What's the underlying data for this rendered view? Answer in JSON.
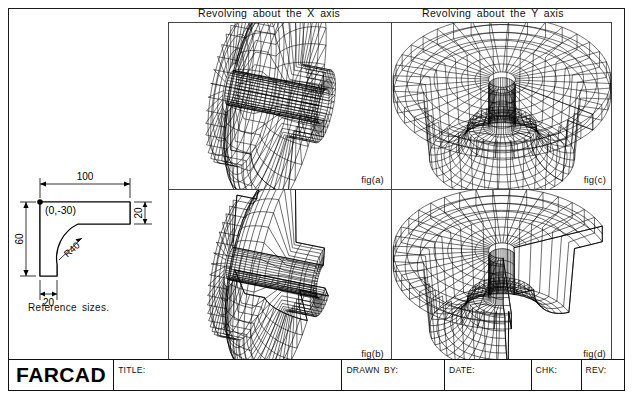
{
  "sheet": {
    "headings": {
      "x_axis": "Revolving about the X axis",
      "y_axis": "Revolving about the Y axis"
    },
    "figures": [
      {
        "id": "fig-a",
        "label": "fig(a)",
        "axis": "X",
        "kind": "full-revolution-solid"
      },
      {
        "id": "fig-c",
        "label": "fig(c)",
        "axis": "Y",
        "kind": "full-revolution-solid"
      },
      {
        "id": "fig-b",
        "label": "fig(b)",
        "axis": "X",
        "kind": "partial-revolution-solid"
      },
      {
        "id": "fig-d",
        "label": "fig(d)",
        "axis": "Y",
        "kind": "partial-revolution-solid"
      }
    ],
    "reference": {
      "caption": "Reference sizes.",
      "origin_label": "(0,-30)",
      "dim_top": "100",
      "dim_left": "60",
      "dim_right": "20",
      "dim_bottom": "20",
      "radius": "R40"
    },
    "title_block": {
      "logo": "FARCAD",
      "fields": [
        {
          "key": "title",
          "label": "TITLE:",
          "value": ""
        },
        {
          "key": "drawn_by",
          "label": "DRAWN  BY:",
          "value": ""
        },
        {
          "key": "date",
          "label": "DATE:",
          "value": ""
        },
        {
          "key": "chk",
          "label": "CHK:",
          "value": ""
        },
        {
          "key": "rev",
          "label": "REV:",
          "value": ""
        }
      ]
    },
    "colors": {
      "ink": "#000000",
      "border": "#1a1a1a",
      "panel_rule": "#444444",
      "paper": "#ffffff"
    }
  }
}
